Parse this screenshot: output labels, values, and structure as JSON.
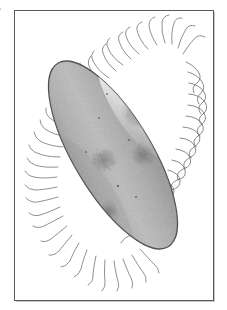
{
  "figure": {
    "edge_label": "6",
    "caption": "",
    "background_color": "#ffffff",
    "frame": {
      "name": "plate-frame",
      "color": "#555a5e",
      "border_width_px": 1,
      "x": 14,
      "y": 10,
      "width": 200,
      "height": 291
    }
  },
  "specimen": {
    "kind": "ciliate-protozoan",
    "common_name": "paramecium",
    "orientation_degrees": -31,
    "body": {
      "center_x": 113,
      "center_y": 155,
      "length_px": 214,
      "width_px": 78,
      "fill_color": "#b2b2b2",
      "outline_color": "#4c4c4c",
      "highlight_color": "#e8e8e8",
      "shadow_color": "#8d8d8d",
      "speckle_color": "#6f6f6f"
    },
    "cilia": {
      "color": "#4f4f4f",
      "count": 96,
      "length_px": 20,
      "style_left": "fine-straight-hairs",
      "style_right": "wavy-looping-strands"
    },
    "vacuoles": [
      {
        "cx": 138,
        "cy": 113,
        "rx": 17,
        "ry": 15,
        "opacity": 0.3
      },
      {
        "cx": 143,
        "cy": 155,
        "rx": 13,
        "ry": 12,
        "opacity": 0.26
      },
      {
        "cx": 104,
        "cy": 160,
        "rx": 14,
        "ry": 13,
        "opacity": 0.24
      },
      {
        "cx": 84,
        "cy": 205,
        "rx": 12,
        "ry": 11,
        "opacity": 0.26
      },
      {
        "cx": 109,
        "cy": 212,
        "rx": 10,
        "ry": 12,
        "opacity": 0.3
      }
    ]
  }
}
